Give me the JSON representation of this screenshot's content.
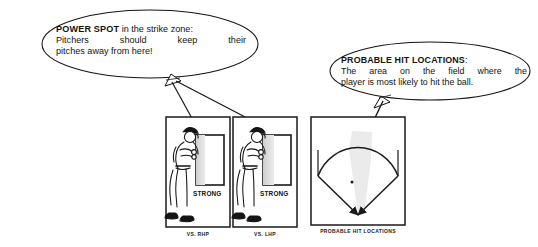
{
  "figure": {
    "background_color": "#ffffff",
    "ink_color": "#15120f",
    "shade_color": "#e2e2e2"
  },
  "callouts": [
    {
      "id": "power-spot",
      "heading": "POWER SPOT",
      "heading_suffix": " in the strike zone:",
      "line2": "Pitchers should keep their",
      "line3": "pitches away from here!",
      "points_to": [
        "vs-rhp-panel",
        "vs-lhp-panel"
      ]
    },
    {
      "id": "probable-hit-locations",
      "heading": "PROBABLE HIT LOCATIONS",
      "heading_suffix": ":",
      "line2": "The area on the field where the",
      "line3": "player is most likely to hit the ball.",
      "points_to": [
        "field-panel"
      ]
    }
  ],
  "panels": [
    {
      "id": "vs-rhp-panel",
      "caption": "VS. RHP",
      "zone_label": "STRONG",
      "batter_stance": "right-handed-batter"
    },
    {
      "id": "vs-lhp-panel",
      "caption": "VS. LHP",
      "zone_label": "STRONG",
      "batter_stance": "right-handed-batter"
    },
    {
      "id": "field-panel",
      "caption": "PROBABLE HIT LOCATIONS",
      "shaded_region": "center-field-wedge",
      "markers": [
        "center-dot",
        "left-foul-arrow",
        "right-foul-arrow"
      ]
    }
  ]
}
